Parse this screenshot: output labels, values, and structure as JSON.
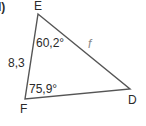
{
  "problem": {
    "label": "d)"
  },
  "triangle": {
    "vertices": [
      {
        "name": "E",
        "x": 38,
        "y": 14
      },
      {
        "name": "F",
        "x": 25,
        "y": 99
      },
      {
        "name": "D",
        "x": 130,
        "y": 89
      }
    ],
    "sides": {
      "EF": "8,3",
      "ED": "f"
    },
    "angles": {
      "E": "60,2°",
      "F": "75,9°"
    },
    "colors": {
      "stroke": "#555555",
      "text": "#2a2a2a",
      "unknown_side": "#8a8a8a"
    }
  }
}
